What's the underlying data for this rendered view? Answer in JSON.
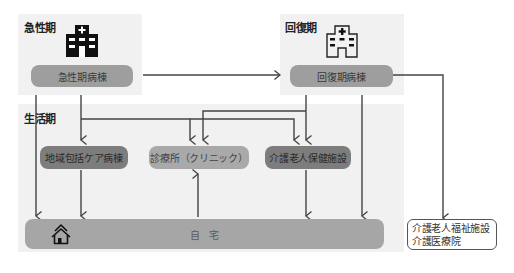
{
  "phases": {
    "acute": {
      "label": "急性期",
      "ward": "急性期病棟",
      "icon": "hospital-filled-icon"
    },
    "recovery": {
      "label": "回復期",
      "ward": "回復期病棟",
      "icon": "hospital-outline-icon"
    },
    "living": {
      "label": "生活期",
      "facilities": [
        {
          "label": "地域包括ケア病棟"
        },
        {
          "label": "診療所（クリニック）"
        },
        {
          "label": "介護老人保健施設"
        }
      ],
      "home": {
        "label": "自　宅",
        "icon": "house-icon"
      }
    }
  },
  "external": {
    "lines": [
      "介護老人福祉施設",
      "介護医療院"
    ]
  },
  "colors": {
    "panel": "#f1f1f1",
    "line": "#444444",
    "pill": "#9e9e9e",
    "pill_dark": "#7d7d7d"
  }
}
